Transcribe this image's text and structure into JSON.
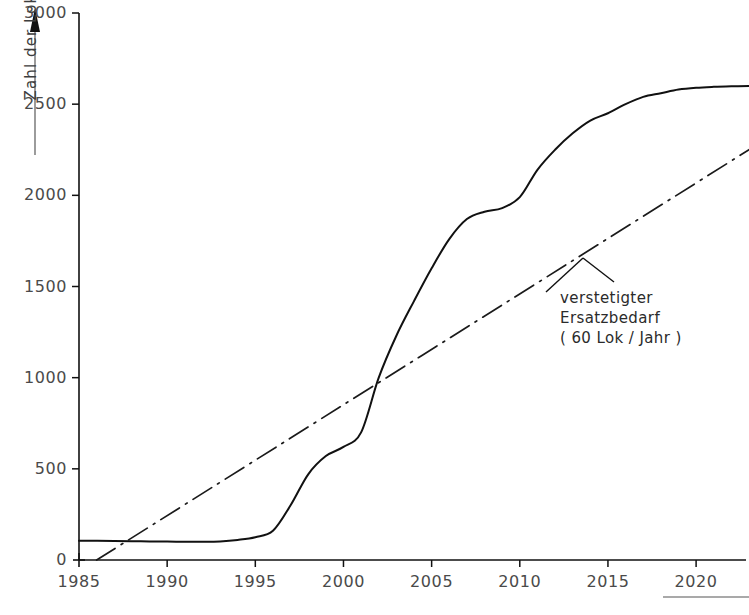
{
  "chart_data": {
    "type": "line",
    "title": "",
    "xlabel": "",
    "ylabel": "Zahl der Lok",
    "xlim": [
      1985,
      2023
    ],
    "ylim": [
      0,
      3000
    ],
    "grid": false,
    "legend_position": "inline-annotation",
    "xticks": [
      1985,
      1990,
      1995,
      2000,
      2005,
      2010,
      2015,
      2020
    ],
    "xtick_labels": [
      "1985",
      "1990",
      "1995",
      "2000",
      "2005",
      "2010",
      "2015",
      "2020"
    ],
    "yticks": [
      0,
      500,
      1000,
      1500,
      2000,
      2500,
      3000
    ],
    "ytick_labels": [
      "0",
      "500",
      "1000",
      "1500",
      "2000",
      "2500",
      "3000"
    ],
    "annotations": [
      {
        "name": "verstetigter-ersatzbedarf-label",
        "lines": [
          "verstetigter",
          "Ersatzbedarf",
          "( 60 Lok / Jahr )"
        ],
        "points_to_series": "verstetigter Ersatzbedarf"
      }
    ],
    "series": [
      {
        "name": "kumulierter Bedarf",
        "style": "solid",
        "color": "#111111",
        "x": [
          1985,
          1986,
          1987,
          1988,
          1989,
          1990,
          1991,
          1992,
          1993,
          1994,
          1995,
          1996,
          1997,
          1998,
          1999,
          2000,
          2001,
          2002,
          2003,
          2004,
          2005,
          2006,
          2007,
          2008,
          2009,
          2010,
          2011,
          2012,
          2013,
          2014,
          2015,
          2016,
          2017,
          2018,
          2019,
          2020,
          2021,
          2022,
          2023
        ],
        "values": [
          105,
          105,
          104,
          103,
          102,
          101,
          100,
          100,
          102,
          110,
          125,
          160,
          300,
          470,
          570,
          620,
          700,
          1000,
          1230,
          1420,
          1600,
          1760,
          1870,
          1910,
          1930,
          1990,
          2140,
          2250,
          2340,
          2410,
          2450,
          2500,
          2540,
          2560,
          2580,
          2590,
          2595,
          2598,
          2600
        ]
      },
      {
        "name": "verstetigter Ersatzbedarf",
        "style": "dash-dot",
        "color": "#1a1a1a",
        "slope_per_year": 60,
        "x": [
          1986,
          2023
        ],
        "values": [
          0,
          2250
        ]
      }
    ]
  }
}
